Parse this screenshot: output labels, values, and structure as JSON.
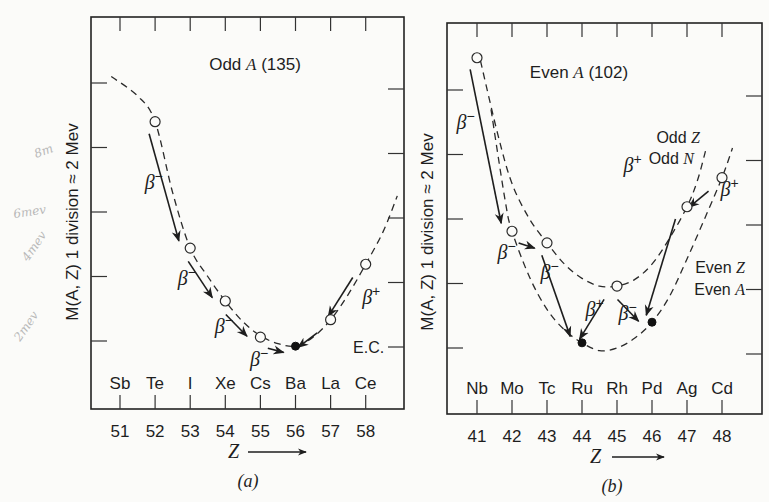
{
  "figure": {
    "caption_a": "(a)",
    "caption_b": "(b)",
    "y_axis_label": "M(A, Z) 1 division ≈ 2 Mev",
    "x_axis_label": "Z",
    "handwritten_notes": [
      "8m",
      "6mev",
      "4mev",
      "2mev"
    ]
  },
  "chart_data": [
    {
      "type": "scatter",
      "panel": "a",
      "title": "Odd A (135)",
      "xlabel": "Z",
      "ylabel": "M(A, Z) 1 division ≈ 2 Mev",
      "y_units": "divisions (1 division ≈ 2 MeV)",
      "x_ticks": [
        51,
        52,
        53,
        54,
        55,
        56,
        57,
        58
      ],
      "element_labels": [
        "Sb",
        "Te",
        "I",
        "Xe",
        "Cs",
        "Ba",
        "La",
        "Ce"
      ],
      "xlim": [
        50.2,
        58.9
      ],
      "ylim": [
        -1.0,
        5.1
      ],
      "y_ticks": [
        0,
        1,
        2,
        3,
        4
      ],
      "curves": [
        {
          "name": "Odd A parabola",
          "x": [
            50.75,
            51.5,
            52.0,
            52.5,
            53.0,
            53.5,
            54.0,
            54.5,
            55.0,
            55.5,
            56.0,
            56.5,
            57.0,
            57.5,
            58.0,
            58.5,
            58.9
          ],
          "y": [
            4.1,
            3.8,
            3.4,
            2.3,
            1.44,
            1.0,
            0.62,
            0.3,
            0.08,
            -0.04,
            -0.08,
            0.06,
            0.33,
            0.72,
            1.19,
            1.7,
            2.25
          ]
        }
      ],
      "points": [
        {
          "element": "Te",
          "Z": 52,
          "mass": 3.4,
          "stable": false
        },
        {
          "element": "I",
          "Z": 53,
          "mass": 1.44,
          "stable": false
        },
        {
          "element": "Xe",
          "Z": 54,
          "mass": 0.62,
          "stable": false
        },
        {
          "element": "Cs",
          "Z": 55,
          "mass": 0.06,
          "stable": false
        },
        {
          "element": "Ba",
          "Z": 56,
          "mass": -0.08,
          "stable": true
        },
        {
          "element": "La",
          "Z": 57,
          "mass": 0.33,
          "stable": false
        },
        {
          "element": "Ce",
          "Z": 58,
          "mass": 1.19,
          "stable": false
        }
      ],
      "transitions": [
        {
          "from": 52,
          "to": 53,
          "label": "β",
          "sign": "−"
        },
        {
          "from": 53,
          "to": 54,
          "label": "β",
          "sign": "−"
        },
        {
          "from": 54,
          "to": 55,
          "label": "β",
          "sign": "−"
        },
        {
          "from": 55,
          "to": 56,
          "label": "β",
          "sign": "−"
        },
        {
          "from": 57,
          "to": 56,
          "label": "E.C.",
          "sign": ""
        },
        {
          "from": 58,
          "to": 57,
          "label": "β",
          "sign": "+"
        }
      ]
    },
    {
      "type": "scatter",
      "panel": "b",
      "title": "Even A (102)",
      "xlabel": "Z",
      "ylabel": "M(A, Z) 1 division ≈ 2 Mev",
      "y_units": "divisions (1 division ≈ 2 MeV)",
      "x_ticks": [
        41,
        42,
        43,
        44,
        45,
        46,
        47,
        48
      ],
      "element_labels": [
        "Nb",
        "Mo",
        "Tc",
        "Ru",
        "Rh",
        "Pd",
        "Ag",
        "Cd"
      ],
      "xlim": [
        40.2,
        49.0
      ],
      "ylim": [
        -1.0,
        5.1
      ],
      "y_ticks": [
        0,
        1,
        2,
        3,
        4
      ],
      "curves": [
        {
          "name": "Odd Z Odd N",
          "label_lines": [
            "Odd Z",
            "Odd N"
          ],
          "x": [
            41.1,
            41.6,
            42.0,
            42.5,
            43.0,
            43.5,
            44.0,
            44.5,
            45.0,
            45.5,
            46.0,
            46.5,
            47.0,
            47.3,
            47.55
          ],
          "y": [
            4.45,
            3.3,
            2.55,
            2.0,
            1.63,
            1.3,
            1.08,
            0.96,
            0.96,
            1.06,
            1.3,
            1.7,
            2.19,
            2.6,
            3.1
          ]
        },
        {
          "name": "Even Z Even A",
          "label_lines": [
            "Even Z",
            "Even A"
          ],
          "x": [
            41.4,
            41.8,
            42.0,
            42.5,
            43.0,
            43.5,
            44.0,
            44.5,
            45.0,
            45.5,
            46.0,
            46.5,
            47.0,
            47.5,
            48.0,
            48.3
          ],
          "y": [
            3.7,
            2.3,
            1.81,
            1.1,
            0.6,
            0.28,
            0.08,
            -0.04,
            0.0,
            0.15,
            0.4,
            0.8,
            1.38,
            2.0,
            2.64,
            3.1
          ]
        }
      ],
      "points": [
        {
          "element": "Nb",
          "Z": 41,
          "mass": 4.5,
          "stable": false
        },
        {
          "element": "Mo",
          "Z": 42,
          "mass": 1.81,
          "stable": false
        },
        {
          "element": "Tc",
          "Z": 43,
          "mass": 1.63,
          "stable": false
        },
        {
          "element": "Ru",
          "Z": 44,
          "mass": 0.08,
          "stable": true
        },
        {
          "element": "Rh",
          "Z": 45,
          "mass": 0.96,
          "stable": false
        },
        {
          "element": "Pd",
          "Z": 46,
          "mass": 0.4,
          "stable": true
        },
        {
          "element": "Ag",
          "Z": 47,
          "mass": 2.19,
          "stable": false
        },
        {
          "element": "Cd",
          "Z": 48,
          "mass": 2.64,
          "stable": false
        }
      ],
      "transitions": [
        {
          "from": 41,
          "to": 42,
          "label": "β",
          "sign": "−"
        },
        {
          "from": 42,
          "to": 43,
          "label": "β",
          "sign": "−"
        },
        {
          "from": 43,
          "to": 44,
          "label": "β",
          "sign": "−"
        },
        {
          "from": 45,
          "to": 44,
          "label": "β",
          "sign": "+"
        },
        {
          "from": 45,
          "to": 46,
          "label": "β",
          "sign": "−"
        },
        {
          "from": 47,
          "to": 46,
          "label": "β",
          "sign": "+"
        },
        {
          "from": 48,
          "to": 47,
          "label": "β",
          "sign": "+"
        }
      ]
    }
  ]
}
